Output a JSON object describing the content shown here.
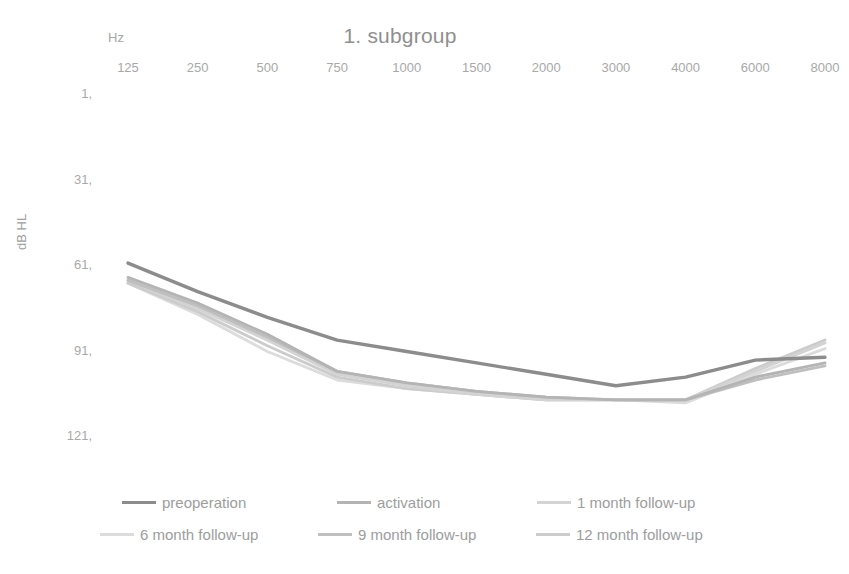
{
  "chart_data": {
    "type": "line",
    "title": "1. subgroup",
    "xlabel": "Hz",
    "ylabel": "dB HL",
    "categories": [
      "125",
      "250",
      "500",
      "750",
      "1000",
      "1500",
      "2000",
      "3000",
      "4000",
      "6000",
      "8000"
    ],
    "ytick_labels": [
      "1,",
      "31,",
      "61,",
      "91,",
      "121,"
    ],
    "ytick_values": [
      1,
      31,
      61,
      91,
      121
    ],
    "ylim": [
      1,
      121
    ],
    "y_inverted": true,
    "grid": false,
    "legend_position": "bottom",
    "series": [
      {
        "name": "preoperation",
        "color": "#8c8c8c",
        "values": [
          60,
          70,
          79,
          87,
          91,
          95,
          99,
          103,
          100,
          94,
          93
        ]
      },
      {
        "name": "activation",
        "color": "#b4b4b4",
        "values": [
          65,
          74,
          85,
          98,
          102,
          105,
          107,
          108,
          108,
          100,
          95
        ]
      },
      {
        "name": "1 month follow-up",
        "color": "#d3d3d3",
        "values": [
          66,
          76,
          87,
          99,
          103,
          106,
          108,
          108,
          108,
          98,
          88
        ]
      },
      {
        "name": "6 month follow-up",
        "color": "#dcdcdc",
        "values": [
          67,
          78,
          91,
          101,
          104,
          106,
          108,
          108,
          109,
          99,
          90
        ]
      },
      {
        "name": "9 month follow-up",
        "color": "#bfbfbf",
        "values": [
          66,
          75,
          86,
          98,
          102,
          105,
          107,
          108,
          108,
          101,
          96
        ]
      },
      {
        "name": "12 month follow-up",
        "color": "#cccccc",
        "values": [
          67,
          77,
          89,
          100,
          104,
          106,
          108,
          108,
          108,
          97,
          87
        ]
      }
    ]
  },
  "legend": {
    "rows": [
      [
        "preoperation",
        "activation",
        "1 month follow-up"
      ],
      [
        "6 month follow-up",
        "9 month follow-up",
        "12 month follow-up"
      ]
    ]
  }
}
